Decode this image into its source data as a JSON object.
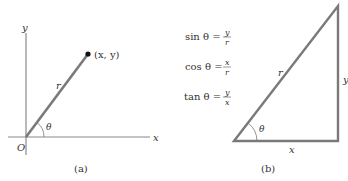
{
  "panel_a": {
    "caption": "(a)",
    "axis_x_label": "x",
    "axis_y_label": "y",
    "origin_label": "O",
    "point_label": "(x, y)",
    "radius_label": "r",
    "angle_label": "θ"
  },
  "panel_b": {
    "caption": "(b)",
    "hypotenuse_label": "r",
    "adjacent_label": "x",
    "opposite_label": "y",
    "angle_label": "θ",
    "formulas": [
      {
        "fn": "sin θ =",
        "num": "y",
        "den": "r"
      },
      {
        "fn": "cos θ =",
        "num": "x",
        "den": "r"
      },
      {
        "fn": "tan θ =",
        "num": "y",
        "den": "x"
      }
    ]
  },
  "colors": {
    "line": "#7a7a7a",
    "axis": "#8a8a8a",
    "text": "#333333",
    "point": "#111111"
  }
}
